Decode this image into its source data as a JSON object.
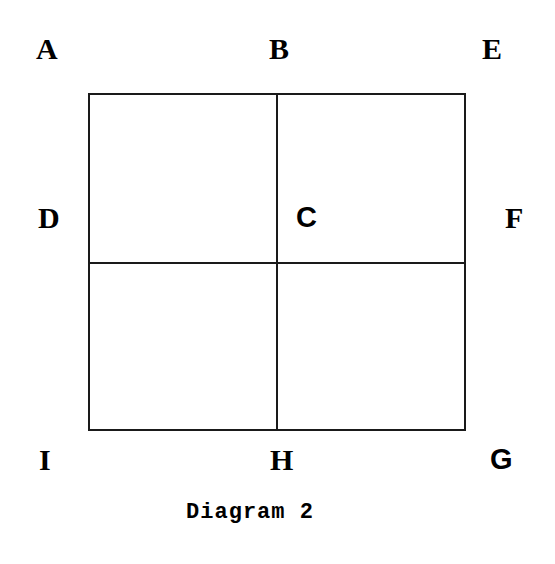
{
  "figure": {
    "caption": "Diagram 2",
    "background_color": "#ffffff",
    "line_color": "#1a1a1a",
    "text_color": "#000000",
    "labels": {
      "A": "A",
      "B": "B",
      "E": "E",
      "D": "D",
      "C": "C",
      "F": "F",
      "I": "I",
      "H": "H",
      "G": "G"
    }
  },
  "chart_data": {
    "type": "diagram",
    "title": "Diagram 2",
    "shape": {
      "outline": "square",
      "x": 88,
      "y": 93,
      "width": 378,
      "height": 338,
      "internal_lines": [
        {
          "orientation": "vertical",
          "x": 276,
          "from_y": 93,
          "to_y": 431
        },
        {
          "orientation": "horizontal",
          "y": 262,
          "from_x": 88,
          "to_x": 466
        }
      ],
      "quadrants": 4
    },
    "annotations": [
      {
        "text": "A",
        "position": "outside-top-left",
        "x": 46,
        "y": 49
      },
      {
        "text": "B",
        "position": "outside-top-center",
        "x": 279,
        "y": 49
      },
      {
        "text": "E",
        "position": "outside-top-right",
        "x": 492,
        "y": 49
      },
      {
        "text": "D",
        "position": "outside-middle-left",
        "x": 49,
        "y": 218
      },
      {
        "text": "C",
        "position": "inside-upper-right-quadrant",
        "x": 306,
        "y": 218
      },
      {
        "text": "F",
        "position": "outside-middle-right",
        "x": 514,
        "y": 218
      },
      {
        "text": "I",
        "position": "outside-bottom-left",
        "x": 48,
        "y": 460
      },
      {
        "text": "H",
        "position": "outside-bottom-center",
        "x": 280,
        "y": 460
      },
      {
        "text": "G",
        "position": "outside-bottom-right",
        "x": 501,
        "y": 460
      }
    ]
  }
}
